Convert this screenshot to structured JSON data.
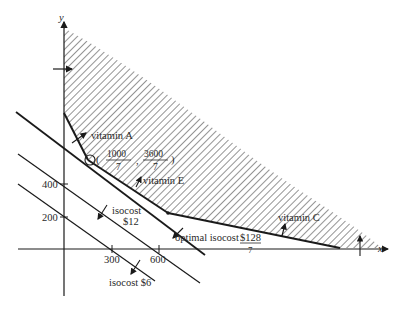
{
  "axes": {
    "x_label": "x",
    "y_label": "y",
    "x_ticks": [
      {
        "label": "300",
        "value": 300
      },
      {
        "label": "600",
        "value": 600
      }
    ],
    "y_ticks": [
      {
        "label": "400",
        "value": 400
      },
      {
        "label": "200",
        "value": 200
      }
    ]
  },
  "constraints": {
    "vitamin_a": "vitamin A",
    "vitamin_e": "vitamin E",
    "vitamin_c": "vitamin C"
  },
  "optimal_point": {
    "open": "(",
    "x_num": "1000",
    "x_den": "7",
    "comma": ",",
    "y_num": "3600",
    "y_den": "7",
    "close": ")"
  },
  "isocost_lines": {
    "isocost_6": "isocost $6",
    "isocost_12_line1": "isocost",
    "isocost_12_line2": "$12",
    "optimal_prefix": "optimal isocost ",
    "optimal_num": "$128",
    "optimal_den": "7"
  },
  "colors": {
    "ink": "#1a1a1a",
    "hatch": "#3a3a3a",
    "background": "#ffffff"
  }
}
